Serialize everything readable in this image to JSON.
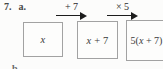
{
  "problem": {
    "number": "7.",
    "part": "a.",
    "next_part_fragment": "b."
  },
  "diagram": {
    "type": "flow-machine",
    "arrows": [
      {
        "label": "+ 7"
      },
      {
        "label": "× 5"
      }
    ],
    "boxes": [
      {
        "pre": "",
        "var": "x",
        "post": ""
      },
      {
        "pre": "",
        "var": "x",
        "post": " + 7"
      },
      {
        "pre": "5(",
        "var": "x",
        "post": " + 7)"
      }
    ],
    "colors": {
      "background": "#fcfcfb",
      "box_border": "#a2a2a2",
      "text": "#3a3a3a",
      "arrow": "#1c1c1c"
    }
  }
}
